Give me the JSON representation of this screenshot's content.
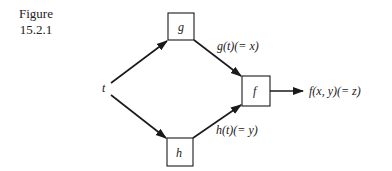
{
  "figure": {
    "caption_line1": "Figure",
    "caption_line2": "15.2.1"
  },
  "nodes": {
    "input": {
      "label": "t"
    },
    "g": {
      "label": "g"
    },
    "h": {
      "label": "h"
    },
    "f": {
      "label": "f"
    }
  },
  "edges": {
    "t_to_g": {
      "label": ""
    },
    "t_to_h": {
      "label": ""
    },
    "g_to_f": {
      "label": "g(t)(= x)"
    },
    "h_to_f": {
      "label": "h(t)(= y)"
    },
    "f_to_output": {
      "label": "f(x, y)(= z)"
    }
  },
  "colors": {
    "stroke": "#1a1a1a",
    "background": "#ffffff"
  }
}
